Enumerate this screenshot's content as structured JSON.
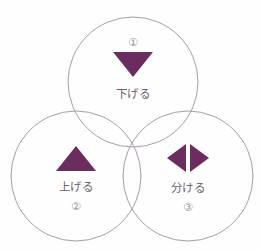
{
  "diagram": {
    "title": "",
    "type": "venn-three-circle",
    "colors": {
      "accent": "#6b2d5f",
      "accent_dark": "#5c2751",
      "circle_stroke": "#a99aae",
      "label_text": "#6e5f73",
      "number_text": "#9b92a6",
      "background": "#fefefe"
    },
    "circles": [
      {
        "id": "top",
        "cx": 133,
        "cy": 82,
        "r": 65
      },
      {
        "id": "left",
        "cx": 76,
        "cy": 176,
        "r": 65
      },
      {
        "id": "right",
        "cx": 188,
        "cy": 176,
        "r": 65
      }
    ],
    "groups": [
      {
        "id": "top",
        "number": "①",
        "icon": "triangle-down-icon",
        "label": "下げる",
        "order": [
          "number",
          "icon",
          "label"
        ]
      },
      {
        "id": "left",
        "number": "②",
        "icon": "triangle-up-icon",
        "label": "上げる",
        "order": [
          "icon",
          "label",
          "number"
        ]
      },
      {
        "id": "right",
        "number": "③",
        "icon": "split-arrows-icon",
        "label": "分ける",
        "order": [
          "icon",
          "label",
          "number"
        ]
      }
    ]
  }
}
